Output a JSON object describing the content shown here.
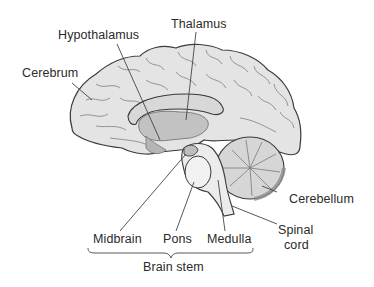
{
  "diagram": {
    "labels": {
      "thalamus": "Thalamus",
      "hypothalamus": "Hypothalamus",
      "cerebrum": "Cerebrum",
      "cerebellum": "Cerebellum",
      "spinal_cord_line1": "Spinal",
      "spinal_cord_line2": "cord",
      "midbrain": "Midbrain",
      "pons": "Pons",
      "medulla": "Medulla",
      "brain_stem": "Brain stem"
    },
    "colors": {
      "background": "#ffffff",
      "outline": "#3a3a3a",
      "cerebrum_fill": "#e4e4e4",
      "sulcus": "#8a8a8a",
      "inner_fill": "#cfcfcf",
      "thalamus_fill": "#bdbdbd",
      "cerebellum_fill": "#d6d6d6",
      "cerebellum_rim": "#8f8f8f",
      "brainstem_fill": "#ececec",
      "leader_line": "#444444",
      "text": "#2a2a2a"
    }
  }
}
